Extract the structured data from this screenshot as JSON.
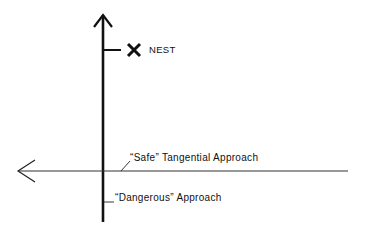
{
  "diagram": {
    "labels": {
      "nest": "NEST",
      "safe": "“Safe”  Tangential  Approach",
      "dangerous": "“Dangerous”  Approach"
    },
    "markers": {
      "nest_marker": "x-mark"
    },
    "colors": {
      "ink": "#111111",
      "background": "#ffffff"
    }
  }
}
